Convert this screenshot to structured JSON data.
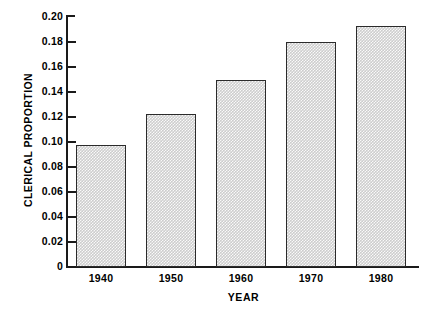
{
  "chart_data": {
    "type": "bar",
    "title": "",
    "xlabel": "YEAR",
    "ylabel": "CLERICAL PROPORTION",
    "categories": [
      "1940",
      "1950",
      "1960",
      "1970",
      "1980"
    ],
    "values": [
      0.0975,
      0.1225,
      0.1495,
      0.18,
      0.193
    ],
    "ylim": [
      0,
      0.2
    ],
    "ytick_labels": [
      "0.20",
      "0.18",
      "0.16",
      "0.14",
      "0.12",
      "0.10",
      "0.08",
      "0.06",
      "0.04",
      "0.02",
      "0"
    ],
    "ytick_values": [
      0.2,
      0.18,
      0.16,
      0.14,
      0.12,
      0.1,
      0.08,
      0.06,
      0.04,
      0.02,
      0
    ],
    "grid": false,
    "legend": false,
    "legend_position": "none",
    "bar_fill_color": "#cdcdcd",
    "bar_border_color": "#2b2b2b",
    "axis_color": "#1a1a1a",
    "background_color": "#ffffff"
  }
}
